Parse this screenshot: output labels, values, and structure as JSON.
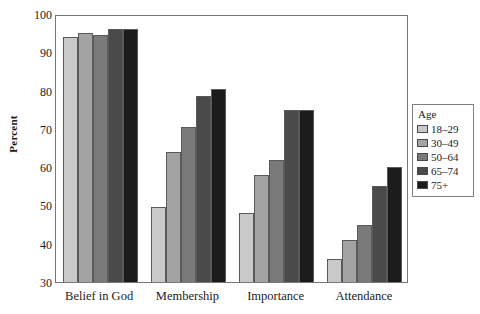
{
  "chart_data": {
    "type": "bar",
    "title": "",
    "subtitle": "",
    "xlabel": "",
    "ylabel": "Percent",
    "ylim": [
      30,
      100
    ],
    "yticks": [
      30,
      40,
      50,
      60,
      70,
      80,
      90,
      100
    ],
    "grid": false,
    "categories": [
      "Belief in God",
      "Membership",
      "Importance",
      "Attendance"
    ],
    "legend": {
      "title": "Age",
      "position": "right",
      "entries": [
        "18–29",
        "30–49",
        "50–64",
        "65–74",
        "75+"
      ]
    },
    "series": [
      {
        "name": "18–29",
        "color": "#c9c9c9",
        "values": [
          94,
          49.5,
          48,
          36
        ]
      },
      {
        "name": "30–49",
        "color": "#a3a3a3",
        "values": [
          95,
          64,
          58,
          41
        ]
      },
      {
        "name": "50–64",
        "color": "#7a7a7a",
        "values": [
          94.5,
          70.5,
          62,
          45
        ]
      },
      {
        "name": "65–74",
        "color": "#4a4a4a",
        "values": [
          96,
          78.5,
          75,
          55
        ]
      },
      {
        "name": "75+",
        "color": "#1c1c1c",
        "values": [
          96,
          80.5,
          75,
          60
        ]
      }
    ]
  }
}
